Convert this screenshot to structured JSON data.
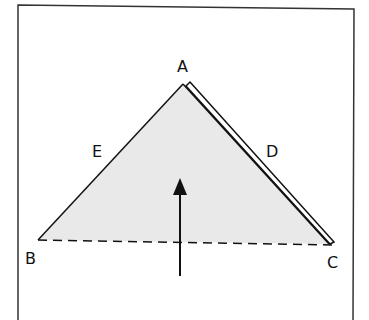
{
  "diagram": {
    "labels": {
      "A": "A",
      "B": "B",
      "C": "C",
      "D": "D",
      "E": "E"
    },
    "colors": {
      "stroke": "#111111",
      "fill": "#e9e9e9",
      "background": "#ffffff"
    }
  }
}
